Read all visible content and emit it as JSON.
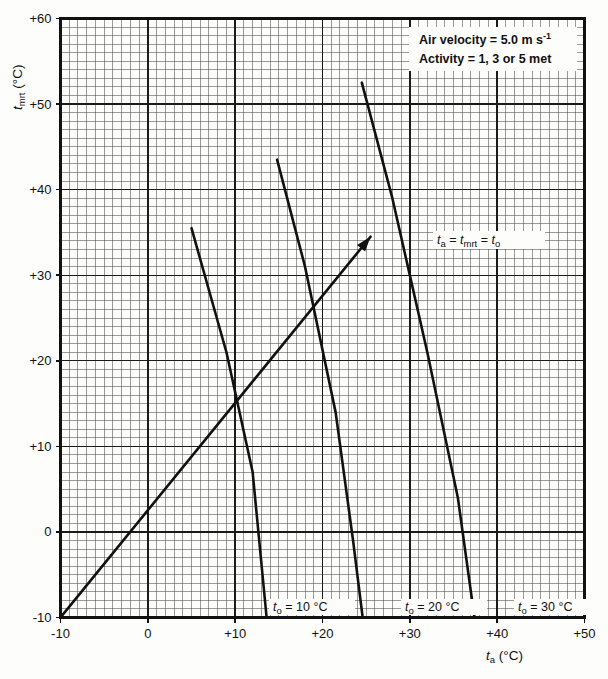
{
  "chart_data": {
    "type": "line",
    "title": "",
    "xlabel": "t_a (°C)",
    "ylabel": "t_mrt (°C)",
    "xlim": [
      -10,
      50
    ],
    "ylim": [
      -10,
      60
    ],
    "xticks": [
      "-10",
      "0",
      "+10",
      "+20",
      "+30",
      "+40",
      "+50"
    ],
    "xtick_values": [
      -10,
      0,
      10,
      20,
      30,
      40,
      50
    ],
    "yticks": [
      "-10",
      "0",
      "+10",
      "+20",
      "+30",
      "+40",
      "+50",
      "+60"
    ],
    "ytick_values": [
      -10,
      0,
      10,
      20,
      30,
      40,
      50,
      60
    ],
    "grid": "minor grid every 1 °C, major grid every 10 °C",
    "legend_position": "top-right inside plot",
    "series": [
      {
        "name": "t_o = 10 °C",
        "label": "t",
        "label_sub": "o",
        "label_rest": " = 10 °C",
        "points": [
          [
            5.0,
            35.5
          ],
          [
            9.0,
            21.0
          ],
          [
            12.0,
            7.0
          ],
          [
            13.6,
            -10.0
          ]
        ]
      },
      {
        "name": "t_o = 20 °C",
        "label": "t",
        "label_sub": "o",
        "label_rest": " = 20 °C",
        "points": [
          [
            14.8,
            43.5
          ],
          [
            18.0,
            31.0
          ],
          [
            21.5,
            14.0
          ],
          [
            23.5,
            -1.0
          ],
          [
            24.6,
            -10.0
          ]
        ]
      },
      {
        "name": "t_o = 30 °C",
        "label": "t",
        "label_sub": "o",
        "label_rest": " = 30 °C",
        "points": [
          [
            24.5,
            52.5
          ],
          [
            28.0,
            39.0
          ],
          [
            32.0,
            21.0
          ],
          [
            35.5,
            4.0
          ],
          [
            37.4,
            -10.0
          ]
        ]
      }
    ],
    "reference_line": {
      "name": "t_a = t_mrt = t_o",
      "from": [
        -10,
        -10
      ],
      "to": [
        25.5,
        34.5
      ],
      "arrow": true,
      "label_parts": [
        "t",
        "a",
        " = ",
        "t",
        "mrt",
        " = ",
        "t",
        "o"
      ]
    },
    "annotations": {
      "air_velocity": "Air velocity  =  5.0 m s",
      "air_velocity_exp": "-1",
      "activity": "Activity  =  1, 3 or 5 met"
    }
  },
  "axes": {
    "y_title_main": "t",
    "y_title_sub": "mrt",
    "y_title_unit": " (°C)",
    "x_title_main": "t",
    "x_title_sub": "a",
    "x_title_unit": " (°C)"
  }
}
